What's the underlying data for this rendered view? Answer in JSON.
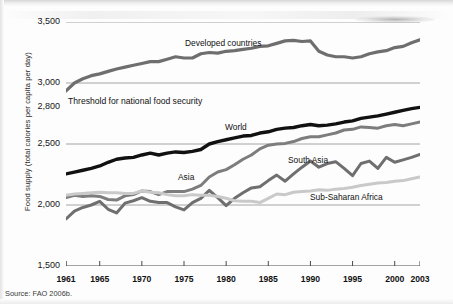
{
  "figure": {
    "y_axis_title": "Food supply (total calories per capita per day)",
    "source_note": "Source: FAO 2006b.",
    "threshold_label": "Threshold for national food security"
  },
  "chart_data": {
    "type": "line",
    "title": "",
    "xlabel": "",
    "ylabel": "Food supply (total calories per capita per day)",
    "xlim": [
      1961,
      2003
    ],
    "ylim": [
      1500,
      3500
    ],
    "grid": true,
    "gridlines": [
      2000,
      2500,
      3000,
      3500
    ],
    "legend": "inline-labels",
    "ytick_labels": [
      "1,500",
      "2,000",
      "2,500",
      "2,800",
      "3,000",
      "3,500"
    ],
    "ytick_values": [
      1500,
      2000,
      2500,
      2800,
      3000,
      3500
    ],
    "xtick_labels": [
      "1961",
      "1965",
      "1970",
      "1975",
      "1980",
      "1985",
      "1990",
      "1995",
      "2000",
      "2003"
    ],
    "xtick_values": [
      1961,
      1965,
      1970,
      1975,
      1980,
      1985,
      1990,
      1995,
      2000,
      2003
    ],
    "annotations": [
      {
        "text": "Threshold for national food security",
        "value": 2800
      }
    ],
    "x": [
      1961,
      1962,
      1963,
      1964,
      1965,
      1966,
      1967,
      1968,
      1969,
      1970,
      1971,
      1972,
      1973,
      1974,
      1975,
      1976,
      1977,
      1978,
      1979,
      1980,
      1981,
      1982,
      1983,
      1984,
      1985,
      1986,
      1987,
      1988,
      1989,
      1990,
      1991,
      1992,
      1993,
      1994,
      1995,
      1996,
      1997,
      1998,
      1999,
      2000,
      2001,
      2002,
      2003
    ],
    "series": [
      {
        "name": "Developed countries",
        "color": "#6e6e6e",
        "values": [
          2935,
          3000,
          3035,
          3060,
          3075,
          3095,
          3115,
          3130,
          3145,
          3160,
          3175,
          3175,
          3195,
          3215,
          3205,
          3205,
          3240,
          3250,
          3245,
          3260,
          3265,
          3275,
          3285,
          3300,
          3305,
          3325,
          3345,
          3350,
          3340,
          3345,
          3260,
          3230,
          3215,
          3215,
          3205,
          3215,
          3240,
          3255,
          3265,
          3290,
          3300,
          3330,
          3355
        ]
      },
      {
        "name": "World",
        "color": "#111111",
        "values": [
          2255,
          2270,
          2285,
          2300,
          2320,
          2350,
          2375,
          2385,
          2390,
          2410,
          2425,
          2410,
          2425,
          2435,
          2430,
          2440,
          2455,
          2500,
          2520,
          2535,
          2550,
          2565,
          2570,
          2590,
          2600,
          2620,
          2630,
          2635,
          2650,
          2660,
          2650,
          2655,
          2665,
          2680,
          2690,
          2710,
          2720,
          2730,
          2745,
          2760,
          2775,
          2790,
          2800
        ]
      },
      {
        "name": "Asia",
        "color": "#7d7d7d",
        "values": [
          2060,
          2080,
          2070,
          2075,
          2070,
          2045,
          2040,
          2075,
          2085,
          2115,
          2110,
          2085,
          2110,
          2110,
          2110,
          2130,
          2160,
          2230,
          2270,
          2290,
          2330,
          2375,
          2410,
          2460,
          2490,
          2500,
          2505,
          2520,
          2545,
          2560,
          2560,
          2575,
          2590,
          2615,
          2620,
          2640,
          2635,
          2630,
          2650,
          2660,
          2650,
          2665,
          2680
        ]
      },
      {
        "name": "South Asia",
        "color": "#6f6f6f",
        "values": [
          1885,
          1950,
          1980,
          2000,
          2030,
          1965,
          1935,
          2015,
          2035,
          2060,
          2030,
          2020,
          2020,
          1985,
          1960,
          2020,
          2055,
          2120,
          2060,
          1995,
          2055,
          2100,
          2140,
          2150,
          2200,
          2245,
          2195,
          2255,
          2310,
          2360,
          2310,
          2340,
          2355,
          2300,
          2240,
          2340,
          2360,
          2300,
          2390,
          2350,
          2370,
          2390,
          2415
        ]
      },
      {
        "name": "Sub-Saharan Africa",
        "color": "#c9c9c9",
        "values": [
          2080,
          2090,
          2095,
          2100,
          2105,
          2100,
          2100,
          2095,
          2095,
          2115,
          2105,
          2100,
          2085,
          2075,
          2075,
          2085,
          2080,
          2080,
          2070,
          2055,
          2035,
          2030,
          2030,
          2020,
          2055,
          2090,
          2085,
          2105,
          2110,
          2115,
          2125,
          2120,
          2130,
          2135,
          2145,
          2160,
          2170,
          2180,
          2185,
          2195,
          2200,
          2215,
          2230
        ]
      }
    ]
  }
}
